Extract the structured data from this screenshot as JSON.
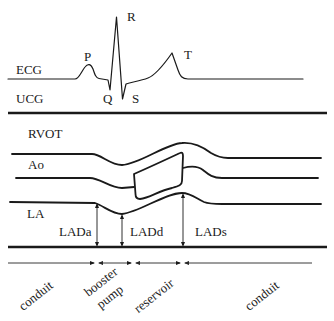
{
  "figure": {
    "ecg": {
      "label": "ECG",
      "waves": {
        "P": "P",
        "Q": "Q",
        "R": "R",
        "S": "S",
        "T": "T"
      }
    },
    "ucg": {
      "label": "UCG"
    },
    "structures": {
      "rvot": "RVOT",
      "ao": "Ao",
      "la": "LA"
    },
    "measurements": {
      "lada": "LADa",
      "ladd": "LADd",
      "lads": "LADs"
    },
    "phases": [
      {
        "label": "conduit"
      },
      {
        "label": "booster pump",
        "lines": [
          "booster",
          "pump"
        ]
      },
      {
        "label": "reservoir"
      },
      {
        "label": "conduit"
      }
    ],
    "colors": {
      "ink": "#1a1a1a",
      "background": "#ffffff"
    }
  }
}
